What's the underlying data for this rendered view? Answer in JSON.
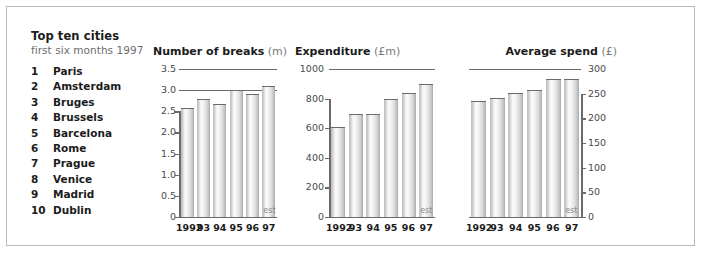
{
  "panel": {
    "title": "Top ten cities",
    "subtitle": "first six months 1997",
    "cities": [
      {
        "rank": "1",
        "name": "Paris"
      },
      {
        "rank": "2",
        "name": "Amsterdam"
      },
      {
        "rank": "3",
        "name": "Bruges"
      },
      {
        "rank": "4",
        "name": "Brussels"
      },
      {
        "rank": "5",
        "name": "Barcelona"
      },
      {
        "rank": "6",
        "name": "Rome"
      },
      {
        "rank": "7",
        "name": "Prague"
      },
      {
        "rank": "8",
        "name": "Venice"
      },
      {
        "rank": "9",
        "name": "Madrid"
      },
      {
        "rank": "10",
        "name": "Dublin"
      }
    ]
  },
  "estimate_label": "est",
  "chart_data": [
    {
      "type": "bar",
      "title": "Number of breaks",
      "unit": "(m)",
      "xlabel": "",
      "ylabel": "",
      "ylim": [
        0,
        3.5
      ],
      "grid": true,
      "legend": "none",
      "categories": [
        "1992",
        "93",
        "94",
        "95",
        "96",
        "97"
      ],
      "values": [
        2.58,
        2.78,
        2.68,
        3.0,
        2.92,
        3.1
      ],
      "yticks": [
        "0",
        "0.5",
        "1.0",
        "1.5",
        "2.0",
        "2.5",
        "3.0",
        "3.5"
      ],
      "ytick_values": [
        0,
        0.5,
        1.0,
        1.5,
        2.0,
        2.5,
        3.0,
        3.5
      ],
      "annotations": [
        "est"
      ],
      "estimated_index": 5
    },
    {
      "type": "bar",
      "title": "Expenditure",
      "unit": "(£m)",
      "xlabel": "",
      "ylabel": "",
      "ylim": [
        0,
        1000
      ],
      "grid": true,
      "legend": "none",
      "categories": [
        "1992",
        "93",
        "94",
        "95",
        "96",
        "97"
      ],
      "values": [
        605,
        695,
        695,
        800,
        840,
        900
      ],
      "yticks": [
        "0",
        "200",
        "400",
        "600",
        "800",
        "1000"
      ],
      "ytick_values": [
        0,
        200,
        400,
        600,
        800,
        1000
      ],
      "annotations": [
        "est"
      ],
      "estimated_index": 5
    },
    {
      "type": "bar",
      "title": "Average spend",
      "unit": "(£)",
      "xlabel": "",
      "ylabel": "",
      "ylim": [
        0,
        300
      ],
      "grid": true,
      "legend": "none",
      "axis_position": "right",
      "categories": [
        "1992",
        "93",
        "94",
        "95",
        "96",
        "97"
      ],
      "values": [
        235,
        242,
        252,
        258,
        280,
        280
      ],
      "yticks": [
        "0",
        "50",
        "100",
        "150",
        "200",
        "250",
        "300"
      ],
      "ytick_values": [
        0,
        50,
        100,
        150,
        200,
        250,
        300
      ],
      "annotations": [
        "est"
      ],
      "estimated_index": 5
    }
  ]
}
